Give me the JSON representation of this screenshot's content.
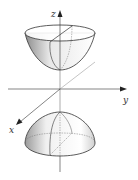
{
  "figure": {
    "axes": {
      "z": {
        "label": "z"
      },
      "y": {
        "label": "y"
      },
      "x": {
        "label": "x"
      }
    },
    "surfaces": [
      {
        "name": "upper-sheet",
        "shape": "bowl (opens upward)"
      },
      {
        "name": "lower-sheet",
        "shape": "dome (opens downward)"
      }
    ],
    "colors": {
      "line": "#333333",
      "hidden_line": "#666666",
      "shade_dark": "#9a9a9a",
      "shade_light": "#ffffff"
    }
  }
}
